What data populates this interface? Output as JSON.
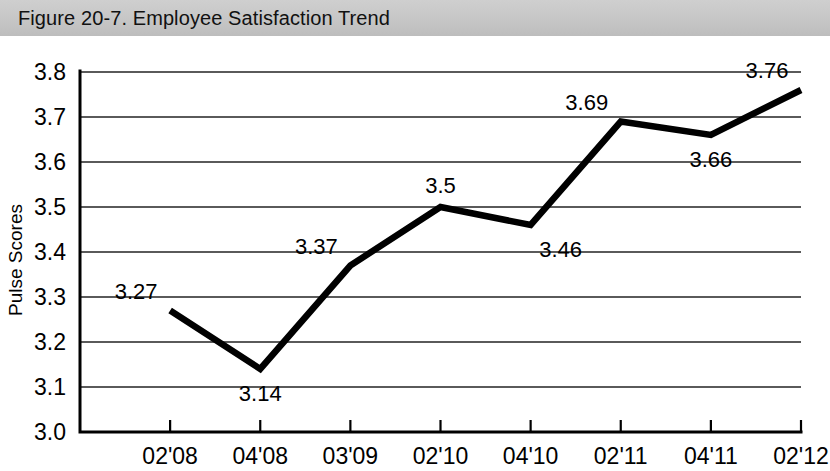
{
  "figure": {
    "title": "Figure 20-7. Employee Satisfaction Trend"
  },
  "chart_data": {
    "type": "line",
    "title": "Figure 20-7. Employee Satisfaction Trend",
    "xlabel": "",
    "ylabel": "Pulse Scores",
    "categories": [
      "02'08",
      "04'08",
      "03'09",
      "02'10",
      "04'10",
      "02'11",
      "04'11",
      "02'12"
    ],
    "values": [
      3.27,
      3.14,
      3.37,
      3.5,
      3.46,
      3.69,
      3.66,
      3.76
    ],
    "point_labels": [
      "3.27",
      "3.14",
      "3.37",
      "3.5",
      "3.46",
      "3.69",
      "3.66",
      "3.76"
    ],
    "point_label_positions": [
      "above-left",
      "below",
      "above-left",
      "above",
      "below-right",
      "above-left",
      "below",
      "above-left"
    ],
    "ylim": [
      3.0,
      3.8
    ],
    "y_ticks": [
      3.0,
      3.1,
      3.2,
      3.3,
      3.4,
      3.5,
      3.6,
      3.7,
      3.8
    ],
    "y_tick_labels": [
      "3.0",
      "3.1",
      "3.2",
      "3.3",
      "3.4",
      "3.5",
      "3.6",
      "3.7",
      "3.8"
    ],
    "grid": "horizontal",
    "legend": "none",
    "series_color": "#000000"
  }
}
